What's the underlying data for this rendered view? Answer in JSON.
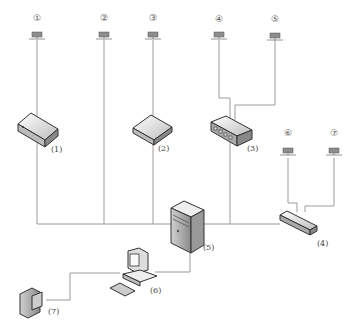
{
  "diagram": {
    "type": "network-topology",
    "terminals": [
      {
        "id": "t1",
        "label": "①",
        "x": 37
      },
      {
        "id": "t2",
        "label": "②",
        "x": 104
      },
      {
        "id": "t3",
        "label": "③",
        "x": 153
      },
      {
        "id": "t4",
        "label": "④",
        "x": 219
      },
      {
        "id": "t5",
        "label": "⑤",
        "x": 275
      },
      {
        "id": "t6",
        "label": "⑥",
        "x": 288
      },
      {
        "id": "t7",
        "label": "⑦",
        "x": 334
      }
    ],
    "devices": [
      {
        "id": "d1",
        "label": "(1)",
        "kind": "router"
      },
      {
        "id": "d2",
        "label": "(2)",
        "kind": "modem"
      },
      {
        "id": "d3",
        "label": "(3)",
        "kind": "switch"
      },
      {
        "id": "d4",
        "label": "(4)",
        "kind": "hub"
      },
      {
        "id": "d5",
        "label": "(5)",
        "kind": "server"
      },
      {
        "id": "d6",
        "label": "(6)",
        "kind": "workstation"
      },
      {
        "id": "d7",
        "label": "(7)",
        "kind": "camera"
      }
    ],
    "colors": {
      "line": "#9a9a9a",
      "device_fill": "#e6e6e6",
      "device_stroke": "#333333"
    }
  }
}
